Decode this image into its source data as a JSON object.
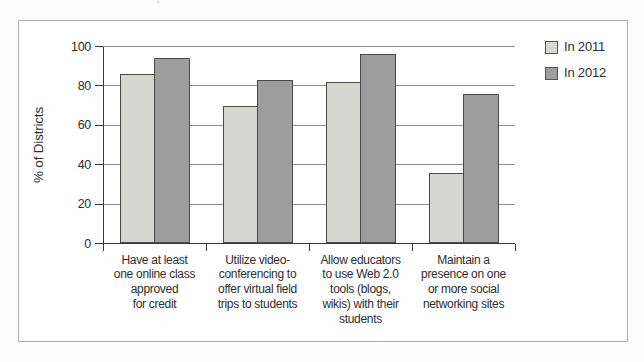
{
  "stray_mark": "'",
  "colors": {
    "bar_2011": "#d7d7d2",
    "bar_2012": "#9d9d9d",
    "bar_border": "#4a4a4a",
    "gridline": "#8f8f8f",
    "axis": "#3a3a3a",
    "text": "#2e2e2e",
    "figure_border": "#b0b0b0",
    "background": "#fefefe"
  },
  "legend": {
    "items": [
      {
        "label": "In 2011",
        "swatch_color": "#d7d7d2"
      },
      {
        "label": "In 2012",
        "swatch_color": "#9d9d9d"
      }
    ]
  },
  "chart_data": {
    "type": "bar",
    "title": "",
    "xlabel": "",
    "ylabel": "% of Districts",
    "ylim": [
      0,
      100
    ],
    "yticks": [
      0,
      20,
      40,
      60,
      80,
      100
    ],
    "grid": true,
    "legend_position": "top-right",
    "categories": [
      "Have at least one online class approved for credit",
      "Utilize video-conferencing to offer virtual field trips to students",
      "Allow educators to use Web 2.0 tools (blogs, wikis) with their students",
      "Maintain a presence on one or more social networking sites"
    ],
    "categories_lines": [
      [
        "Have at least",
        "one online class",
        "approved",
        "for credit"
      ],
      [
        "Utilize video-",
        "conferencing to",
        "offer virtual field",
        "trips to students"
      ],
      [
        "Allow educators",
        "to use Web 2.0",
        "tools (blogs,",
        "wikis) with their",
        "students"
      ],
      [
        "Maintain a",
        "presence on one",
        "or more social",
        "networking sites"
      ]
    ],
    "series": [
      {
        "name": "In 2011",
        "values": [
          86,
          70,
          82,
          36
        ]
      },
      {
        "name": "In 2012",
        "values": [
          94,
          83,
          96,
          76
        ]
      }
    ]
  }
}
